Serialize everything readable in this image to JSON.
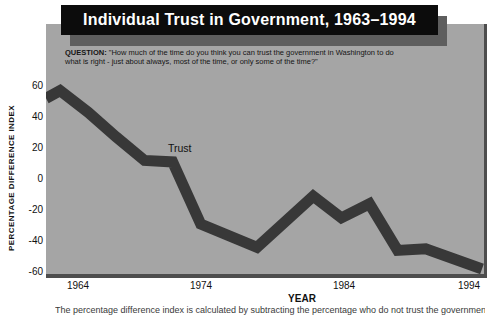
{
  "title": "Individual Trust in Government, 1963–1994",
  "question": {
    "label": "QUESTION:",
    "text": " \"How much of the time do you think you can trust the government in Washington to do what is right - just about always, most of the time, or only some of the time?\""
  },
  "colors": {
    "panel_bg": "#a5a5a5",
    "panel_edge": "#4d4d4d",
    "title_bg": "#0c0c0c",
    "title_text": "#ffffff",
    "title_shadow": "#5e5e5e",
    "line": "#383838"
  },
  "chart_data": {
    "type": "line",
    "title": "Individual Trust in Government, 1963–1994",
    "xlabel": "YEAR",
    "ylabel": "PERCENTAGE DIFFERENCE INDEX",
    "xlim": [
      1963,
      1994
    ],
    "ylim": [
      -60,
      60
    ],
    "x_ticks": [
      "1964",
      "1974",
      "1984",
      "1994"
    ],
    "y_ticks": [
      "60",
      "40",
      "20",
      "0",
      "-20",
      "-40",
      "-60"
    ],
    "grid": false,
    "legend_position": "inline-annotation",
    "annotation": "Trust",
    "series": [
      {
        "name": "Trust",
        "points": [
          [
            1963,
            52
          ],
          [
            1964,
            57
          ],
          [
            1966,
            43
          ],
          [
            1968,
            27
          ],
          [
            1970,
            12
          ],
          [
            1972,
            11
          ],
          [
            1974,
            -29
          ],
          [
            1978,
            -44
          ],
          [
            1982,
            -11
          ],
          [
            1984,
            -25
          ],
          [
            1986,
            -16
          ],
          [
            1988,
            -46
          ],
          [
            1990,
            -45
          ],
          [
            1994,
            -58
          ]
        ]
      }
    ]
  },
  "caption_clipped": "The percentage difference index is calculated by subtracting the percentage who do not trust the government from the percentage who do."
}
